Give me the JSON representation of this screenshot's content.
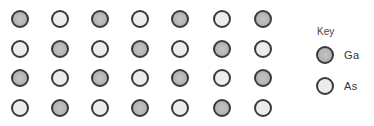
{
  "diagram": {
    "type": "crystal-lattice",
    "rows": [
      [
        "Ga",
        "As",
        "Ga",
        "As",
        "Ga",
        "As",
        "Ga"
      ],
      [
        "As",
        "Ga",
        "As",
        "Ga",
        "As",
        "Ga",
        "As"
      ],
      [
        "Ga",
        "As",
        "Ga",
        "As",
        "Ga",
        "As",
        "Ga"
      ],
      [
        "As",
        "Ga",
        "As",
        "Ga",
        "As",
        "Ga",
        "As"
      ]
    ],
    "colors": {
      "Ga": "#b9b9b9",
      "As": "#ececec",
      "outline": "#3a3a3a"
    }
  },
  "key": {
    "title": "Key",
    "items": [
      {
        "symbol": "Ga",
        "label": "Ga"
      },
      {
        "symbol": "As",
        "label": "As"
      }
    ]
  }
}
